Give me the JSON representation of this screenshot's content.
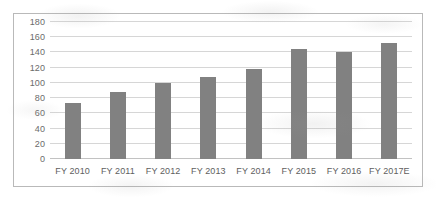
{
  "chart_data": {
    "type": "bar",
    "title": "",
    "subtitle": "",
    "xlabel": "",
    "ylabel": "",
    "categories": [
      "FY 2010",
      "FY 2011",
      "FY 2012",
      "FY 2013",
      "FY 2014",
      "FY 2015",
      "FY 2016",
      "FY 2017E"
    ],
    "values": [
      73,
      88,
      100,
      108,
      118,
      145,
      140,
      152
    ],
    "ylim": [
      0,
      180
    ],
    "ytick_step": 20,
    "yticks": [
      0,
      20,
      40,
      60,
      80,
      100,
      120,
      140,
      160,
      180
    ],
    "ytick_labels": [
      "0",
      "20",
      "40",
      "60",
      "80",
      "100",
      "120",
      "140",
      "160",
      "180"
    ],
    "grid": true,
    "grid_axis": "y",
    "legend": false,
    "legend_position": "none",
    "series": [
      {
        "name": "",
        "color": "#818181",
        "values": [
          73,
          88,
          100,
          108,
          118,
          145,
          140,
          152
        ]
      }
    ]
  },
  "style": {
    "bar_color": "#818181",
    "gridline_color": "#d6d6d6",
    "baseline_color": "#c2c2c2",
    "frame_border_color": "#b9b9b9",
    "tick_label_color": "#6b6b6b",
    "background_color": "#ffffff"
  }
}
